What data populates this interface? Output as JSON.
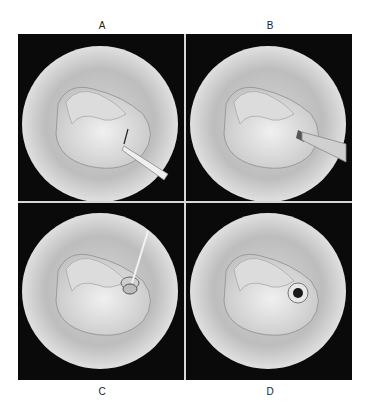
{
  "figure": {
    "panels": [
      {
        "id": "A",
        "label": "A",
        "position": "top-left",
        "instrument": "myringotomy-knife",
        "depicts": "incision in tympanic membrane"
      },
      {
        "id": "B",
        "label": "B",
        "position": "top-right",
        "instrument": "suction-tip",
        "depicts": "suction through incision"
      },
      {
        "id": "C",
        "label": "C",
        "position": "bottom-left",
        "instrument": "tube-inserter",
        "depicts": "tympanostomy tube being inserted"
      },
      {
        "id": "D",
        "label": "D",
        "position": "bottom-right",
        "instrument": "none",
        "depicts": "tympanostomy tube in place"
      }
    ],
    "colors": {
      "background": "#ffffff",
      "panel_bg": "#0a0a0a",
      "divider": "#d8d8d8",
      "ear_canal": "#c8c8c8",
      "membrane": "#e6e6e6",
      "tube_center": "#1a1a1a"
    }
  }
}
